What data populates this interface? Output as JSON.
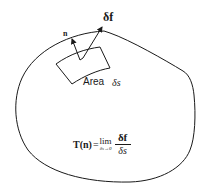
{
  "diagram": {
    "labels": {
      "normal": "n",
      "force": "δf",
      "area_word": "Area",
      "area_symbol": "δs"
    },
    "formula": {
      "lhs": "T(n)",
      "equals": "=",
      "lim": "lim",
      "lim_sub": "δs→0",
      "numerator": "δf",
      "denominator": "δs"
    },
    "colors": {
      "stroke": "#1a1a1a",
      "background": "#ffffff"
    }
  }
}
